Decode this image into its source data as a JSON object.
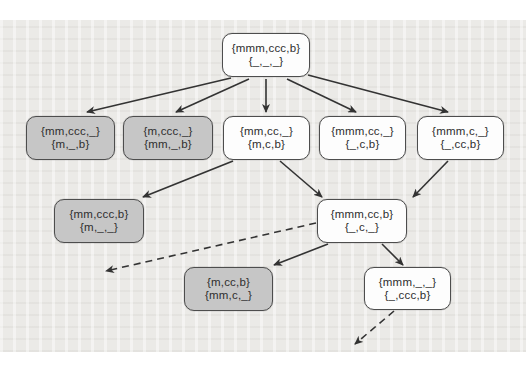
{
  "figure": {
    "colors": {
      "background": "#ebeae7",
      "node_fill": "#fdfdfd",
      "shaded_node_fill": "#c6c6c6",
      "node_border": "#4d4d4d",
      "arrow": "#333333",
      "text": "#2e2e2e"
    }
  },
  "diagram": {
    "nodes": [
      {
        "id": "root",
        "lines": [
          "{mmm,ccc,b}",
          "{_,_,_}"
        ],
        "shaded": false,
        "x": 222,
        "y": 33,
        "w": 88,
        "h": 44
      },
      {
        "id": "l2-1",
        "lines": [
          "{mm,ccc,_}",
          "{m,_,b}"
        ],
        "shaded": true,
        "x": 26,
        "y": 116,
        "w": 89,
        "h": 44
      },
      {
        "id": "l2-2",
        "lines": [
          "{m,ccc,_}",
          "{mm,_,b}"
        ],
        "shaded": true,
        "x": 123,
        "y": 116,
        "w": 90,
        "h": 44
      },
      {
        "id": "l2-3",
        "lines": [
          "{mm,cc,_}",
          "{m,c,b}"
        ],
        "shaded": false,
        "x": 223,
        "y": 116,
        "w": 87,
        "h": 44
      },
      {
        "id": "l2-4",
        "lines": [
          "{mmm,cc,_}",
          "{_,c,b}"
        ],
        "shaded": false,
        "x": 319,
        "y": 116,
        "w": 87,
        "h": 44
      },
      {
        "id": "l2-5",
        "lines": [
          "{mmm,c,_}",
          "{_,cc,b}"
        ],
        "shaded": false,
        "x": 417,
        "y": 116,
        "w": 87,
        "h": 44
      },
      {
        "id": "l3-1",
        "lines": [
          "{mm,ccc,b}",
          "{m,_,_}"
        ],
        "shaded": true,
        "x": 54,
        "y": 199,
        "w": 90,
        "h": 44
      },
      {
        "id": "l3-2",
        "lines": [
          "{mmm,cc,b}",
          "{_,c,_}"
        ],
        "shaded": false,
        "x": 317,
        "y": 199,
        "w": 90,
        "h": 44
      },
      {
        "id": "l4-1",
        "lines": [
          "{m,cc,b}",
          "{mm,c,_}"
        ],
        "shaded": true,
        "x": 184,
        "y": 267,
        "w": 89,
        "h": 44
      },
      {
        "id": "l4-2",
        "lines": [
          "{mmm,_,_}",
          "{_,ccc,b}"
        ],
        "shaded": false,
        "x": 364,
        "y": 267,
        "w": 87,
        "h": 43
      }
    ],
    "edges": [
      {
        "from": "root",
        "to": "l2-1",
        "x1": 231,
        "y1": 78,
        "x2": 87,
        "y2": 112,
        "style": "solid"
      },
      {
        "from": "root",
        "to": "l2-2",
        "x1": 249,
        "y1": 79,
        "x2": 176,
        "y2": 112,
        "style": "solid"
      },
      {
        "from": "root",
        "to": "l2-3",
        "x1": 266,
        "y1": 79,
        "x2": 266,
        "y2": 112,
        "style": "solid"
      },
      {
        "from": "root",
        "to": "l2-4",
        "x1": 287,
        "y1": 79,
        "x2": 356,
        "y2": 112,
        "style": "solid"
      },
      {
        "from": "root",
        "to": "l2-5",
        "x1": 308,
        "y1": 75,
        "x2": 448,
        "y2": 112,
        "style": "solid"
      },
      {
        "from": "l2-3",
        "to": "l3-1",
        "x1": 233,
        "y1": 161,
        "x2": 143,
        "y2": 197,
        "style": "solid"
      },
      {
        "from": "l2-3",
        "to": "l3-2",
        "x1": 280,
        "y1": 161,
        "x2": 322,
        "y2": 197,
        "style": "solid"
      },
      {
        "from": "l2-5",
        "to": "l3-2",
        "x1": 448,
        "y1": 161,
        "x2": 413,
        "y2": 197,
        "style": "solid"
      },
      {
        "from": "l3-2",
        "to": "offscreen-left",
        "x1": 316,
        "y1": 223,
        "x2": 106,
        "y2": 271,
        "style": "dashed"
      },
      {
        "from": "l3-2",
        "to": "l4-1",
        "x1": 328,
        "y1": 244,
        "x2": 274,
        "y2": 265,
        "style": "solid"
      },
      {
        "from": "l3-2",
        "to": "l4-2",
        "x1": 382,
        "y1": 244,
        "x2": 403,
        "y2": 265,
        "style": "solid"
      },
      {
        "from": "l4-2",
        "to": "offscreen-bottom",
        "x1": 394,
        "y1": 311,
        "x2": 355,
        "y2": 344,
        "style": "dashed"
      }
    ]
  }
}
